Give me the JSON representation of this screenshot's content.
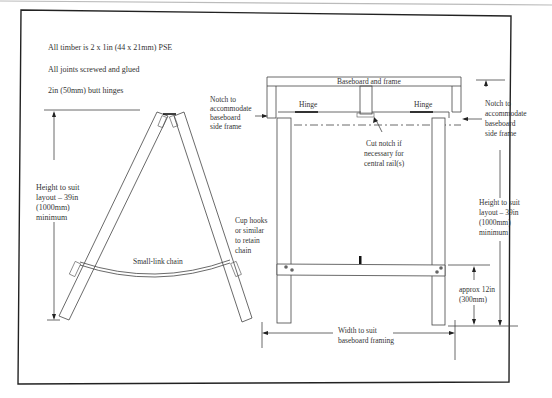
{
  "notes": {
    "line1": "All timber is 2 x 1in (44 x 21mm) PSE",
    "line2": "All joints screwed and glued",
    "line3": "2in (50mm) butt hinges"
  },
  "side_view": {
    "height_label": [
      "Height to suit",
      "layout – 39in",
      "(1000mm)",
      "minimum"
    ],
    "notch_label": [
      "Notch to",
      "accommodate",
      "baseboard",
      "side frame"
    ],
    "cup_hooks_label": [
      "Cup hooks",
      "or similar",
      "to retain",
      "chain"
    ],
    "chain_label": "Small-link chain"
  },
  "front_view": {
    "baseboard_label": "Baseboard and frame",
    "hinge_left": "Hinge",
    "hinge_right": "Hinge",
    "cut_notch_label": [
      "Cut notch if",
      "necessary for",
      "central rail(s)"
    ],
    "notch_label": [
      "Notch to",
      "accommodate",
      "baseboard",
      "side frame"
    ],
    "height_label": [
      "Height to suit",
      "layout – 39in",
      "(1000mm)",
      "minimum"
    ],
    "rail_height_label": [
      "approx 12in",
      "(300mm)"
    ],
    "width_label": [
      "Width to suit",
      "baseboard framing"
    ]
  },
  "colors": {
    "line": "#444444",
    "text": "#333333",
    "frame": "#222222",
    "background": "#ffffff"
  }
}
